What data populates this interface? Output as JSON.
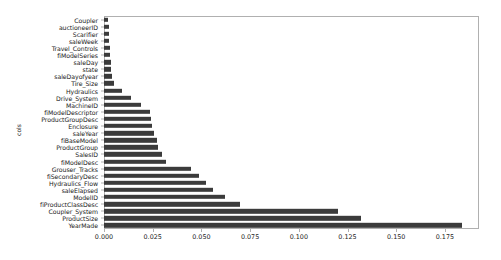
{
  "chart_data": {
    "type": "bar",
    "orientation": "horizontal",
    "title": "",
    "xlabel": "",
    "ylabel": "cols",
    "grid": false,
    "legend": null,
    "xlim": [
      0.0,
      0.1925
    ],
    "xticks": [
      "0.000",
      "0.025",
      "0.050",
      "0.075",
      "0.100",
      "0.125",
      "0.150",
      "0.175"
    ],
    "xtick_values": [
      0.0,
      0.025,
      0.05,
      0.075,
      0.1,
      0.125,
      0.15,
      0.175
    ],
    "bar_color": "#3b3b3b",
    "categories": [
      "Coupler",
      "auctioneerID",
      "Scarifier",
      "saleWeek",
      "Travel_Controls",
      "fiModelSeries",
      "saleDay",
      "state",
      "saleDayofyear",
      "Tire_Size",
      "Hydraulics",
      "Drive_System",
      "MachineID",
      "fiModelDescriptor",
      "ProductGroupDesc",
      "Enclosure",
      "saleYear",
      "fiBaseModel",
      "ProductGroup",
      "SalesID",
      "fiModelDesc",
      "Grouser_Tracks",
      "fiSecondaryDesc",
      "Hydraulics_Flow",
      "saleElapsed",
      "ModelID",
      "fiProductClassDesc",
      "Coupler_System",
      "ProductSize",
      "YearMade"
    ],
    "values": [
      0.0022,
      0.0024,
      0.0026,
      0.0028,
      0.003,
      0.0032,
      0.0034,
      0.0036,
      0.004,
      0.0052,
      0.009,
      0.014,
      0.019,
      0.0235,
      0.024,
      0.0245,
      0.0255,
      0.027,
      0.0275,
      0.03,
      0.032,
      0.0445,
      0.049,
      0.0525,
      0.056,
      0.062,
      0.07,
      0.12,
      0.132,
      0.184
    ]
  }
}
